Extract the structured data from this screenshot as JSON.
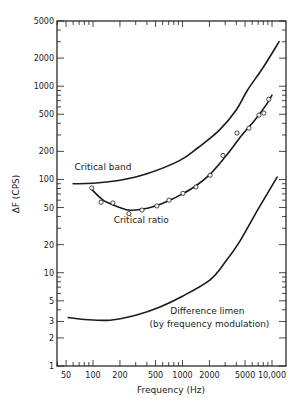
{
  "chart_data": {
    "type": "line",
    "title": "",
    "xlabel": "Frequency (Hz)",
    "ylabel": "ΔF (CPS)",
    "xscale": "log",
    "yscale": "log",
    "xlim": [
      40,
      14000
    ],
    "ylim": [
      1,
      5000
    ],
    "grid": false,
    "legend": "none (inline annotations)",
    "x_ticks": [
      50,
      100,
      200,
      500,
      1000,
      2000,
      5000,
      10000
    ],
    "x_tick_labels": [
      "50",
      "100",
      "200",
      "500",
      "1000",
      "2000",
      "5000",
      "10,000"
    ],
    "y_ticks": [
      1,
      2,
      3,
      5,
      10,
      20,
      50,
      100,
      200,
      500,
      1000,
      2000,
      5000
    ],
    "y_tick_labels": [
      "1",
      "2",
      "3",
      "5",
      "10",
      "20",
      "50",
      "100",
      "200",
      "500",
      "1000",
      "2000",
      "5000"
    ],
    "series": [
      {
        "name": "Critical band",
        "style": "line",
        "x": [
          60,
          100,
          200,
          400,
          935,
          1500,
          2600,
          4000,
          5300,
          8000,
          12000
        ],
        "y": [
          90,
          91,
          98,
          115,
          160,
          220,
          340,
          560,
          900,
          1600,
          3000
        ]
      },
      {
        "name": "Critical ratio",
        "style": "line",
        "x": [
          97,
          130,
          180,
          250,
          350,
          500,
          700,
          1000,
          1400,
          2000,
          3000,
          4500,
          6500,
          8500,
          10000
        ],
        "y": [
          78,
          60,
          52,
          47,
          48,
          52,
          59,
          70,
          85,
          112,
          175,
          290,
          440,
          620,
          800
        ]
      },
      {
        "name": "Critical ratio (measured)",
        "style": "scatter",
        "x": [
          97,
          123,
          167,
          252,
          353,
          518,
          707,
          1012,
          1415,
          2035,
          2830,
          4060,
          5530,
          7150,
          8100,
          9200
        ],
        "y": [
          81,
          57,
          56,
          43,
          47,
          52,
          60,
          71,
          83,
          111,
          181,
          315,
          355,
          490,
          515,
          725
        ]
      },
      {
        "name": "Difference limen (by frequency modulation)",
        "style": "line",
        "x": [
          53,
          80,
          155,
          300,
          560,
          1000,
          2035,
          3000,
          4400,
          7000,
          11400
        ],
        "y": [
          3.3,
          3.15,
          3.1,
          3.5,
          4.3,
          5.6,
          8.4,
          13,
          22,
          48,
          106
        ]
      }
    ],
    "annotations": [
      {
        "text": "Critical band",
        "x": 62,
        "y": 125
      },
      {
        "text": "Critical ratio",
        "x": 170,
        "y": 34
      },
      {
        "text": "Difference limen",
        "x": 1900,
        "y": 3.6
      },
      {
        "text": "(by frequency modulation)",
        "x": 2000,
        "y": 2.6
      }
    ]
  }
}
